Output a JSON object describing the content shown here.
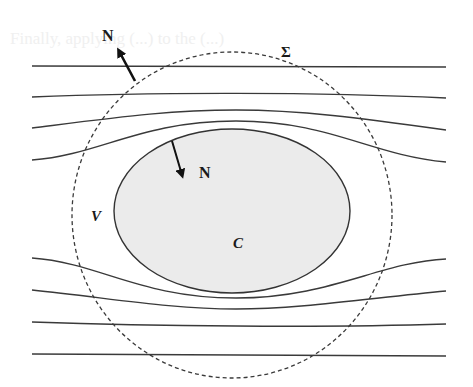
{
  "diagram": {
    "labels": {
      "normal_outer": "N",
      "normal_inner": "N",
      "surface": "Σ",
      "volume": "V",
      "body": "C"
    },
    "bleed_through_text": "Finally, applying (...) to the (...)",
    "colors": {
      "streamline": "#3a3a3a",
      "body_fill": "#ebebeb",
      "control_surface": "#3a3a3a",
      "background": "#ffffff"
    },
    "elements": {
      "streamlines_count": 8,
      "control_surface_style": "dashed circle",
      "body_shape": "ellipse"
    }
  }
}
